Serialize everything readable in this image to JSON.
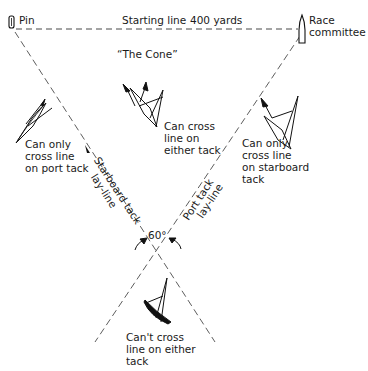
{
  "diagram": {
    "title_fragment": "",
    "start_line": {
      "label": "Starting line",
      "length_label": "400 yards"
    },
    "marks": {
      "pin": "Pin",
      "committee_line1": "Race",
      "committee_line2": "committee"
    },
    "cone_label": "“The Cone”",
    "angle_label": "60°",
    "laylines": {
      "starboard_line1": "Starboard tack",
      "starboard_line2": "lay-line",
      "port_line1": "Port tack",
      "port_line2": "lay-line"
    },
    "zones": {
      "left": [
        "Can only",
        "cross line",
        "on port tack"
      ],
      "center": [
        "Can cross",
        "line on",
        "either tack"
      ],
      "right": [
        "Can only",
        "cross line",
        "on starboard",
        "tack"
      ],
      "bottom": [
        "Can't cross",
        "line on either",
        "tack"
      ]
    },
    "colors": {
      "ink": "#1a1a1a",
      "background": "#ffffff"
    }
  }
}
